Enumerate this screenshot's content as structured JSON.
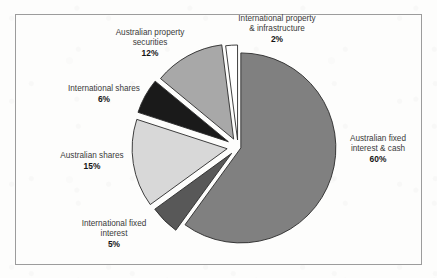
{
  "figure": {
    "frame": {
      "border_color": "#9c9c9c"
    },
    "background_color": "#fdfdfc"
  },
  "chart_data": {
    "type": "pie",
    "title": "",
    "xlabel": "",
    "ylabel": "",
    "legend_position": "none",
    "grid": false,
    "exploded": true,
    "start_angle_deg": 0,
    "direction": "clockwise",
    "units": "percent",
    "total": 100,
    "categories": [
      "Australian fixed interest & cash",
      "International fixed interest",
      "Australian shares",
      "International shares",
      "Australian property securities",
      "International property & infrastructure"
    ],
    "values": [
      60,
      5,
      15,
      6,
      12,
      2
    ],
    "colors": [
      "#808080",
      "#585858",
      "#d8d8d8",
      "#1a1a1a",
      "#a8a8a8",
      "#ffffff"
    ],
    "slices": [
      {
        "name": "Australian fixed interest & cash",
        "value": 60,
        "value_label": "60%",
        "color": "#808080",
        "label_line1": "Australian fixed",
        "label_line2": "interest & cash",
        "label_line3": ""
      },
      {
        "name": "International fixed interest",
        "value": 5,
        "value_label": "5%",
        "color": "#585858",
        "label_line1": "International fixed",
        "label_line2": "interest",
        "label_line3": ""
      },
      {
        "name": "Australian shares",
        "value": 15,
        "value_label": "15%",
        "color": "#d8d8d8",
        "label_line1": "Australian shares",
        "label_line2": "",
        "label_line3": ""
      },
      {
        "name": "International shares",
        "value": 6,
        "value_label": "6%",
        "color": "#1a1a1a",
        "label_line1": "International shares",
        "label_line2": "",
        "label_line3": ""
      },
      {
        "name": "Australian property securities",
        "value": 12,
        "value_label": "12%",
        "color": "#a8a8a8",
        "label_line1": "Australian property",
        "label_line2": "securities",
        "label_line3": ""
      },
      {
        "name": "International property & infrastructure",
        "value": 2,
        "value_label": "2%",
        "color": "#ffffff",
        "label_line1": "International property",
        "label_line2": "& infrastructure",
        "label_line3": ""
      }
    ]
  }
}
